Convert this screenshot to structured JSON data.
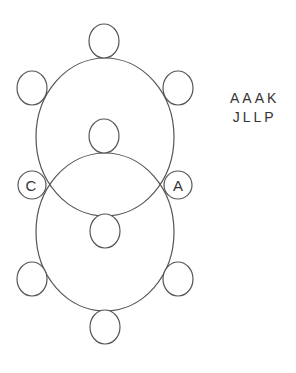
{
  "diagram": {
    "stroke_color": "#555555",
    "label_color": "#333333",
    "big_circles": [
      {
        "name": "upper",
        "cx": 105,
        "cy": 137,
        "rx": 69,
        "ry": 79
      },
      {
        "name": "lower",
        "cx": 105,
        "cy": 232,
        "rx": 69,
        "ry": 79
      }
    ],
    "small_circles": [
      {
        "name": "top",
        "cx": 104,
        "cy": 41,
        "label": ""
      },
      {
        "name": "upper-left",
        "cx": 32,
        "cy": 88,
        "label": ""
      },
      {
        "name": "upper-right",
        "cx": 178,
        "cy": 88,
        "label": ""
      },
      {
        "name": "inner-top",
        "cx": 104,
        "cy": 136,
        "label": ""
      },
      {
        "name": "left-mid",
        "cx": 32,
        "cy": 185,
        "label": "C"
      },
      {
        "name": "right-mid",
        "cx": 178,
        "cy": 185,
        "label": "A"
      },
      {
        "name": "inner-bottom",
        "cx": 105,
        "cy": 231,
        "label": ""
      },
      {
        "name": "lower-left",
        "cx": 32,
        "cy": 279,
        "label": ""
      },
      {
        "name": "lower-right",
        "cx": 178,
        "cy": 279,
        "label": ""
      },
      {
        "name": "bottom",
        "cx": 105,
        "cy": 327,
        "label": ""
      }
    ],
    "labels": {
      "left_mid": "C",
      "right_mid": "A"
    },
    "code_lines": [
      "AAAK",
      "JLLP"
    ]
  }
}
